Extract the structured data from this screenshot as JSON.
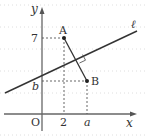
{
  "diagram": {
    "axes": {
      "x_label": "x",
      "y_label": "y",
      "origin_label": "O"
    },
    "points": {
      "A": {
        "label": "A",
        "x_label": "2",
        "y_label": "7"
      },
      "B": {
        "label": "B",
        "x_label": "a",
        "y_label": "b"
      }
    },
    "line": {
      "label": "ℓ"
    },
    "markers": {
      "right_angle": "right-angle-marker"
    },
    "colors": {
      "axis": "#666666",
      "line": "#333333",
      "grid": "#d0d0d0",
      "dashed": "#555555",
      "text": "#333333"
    }
  }
}
